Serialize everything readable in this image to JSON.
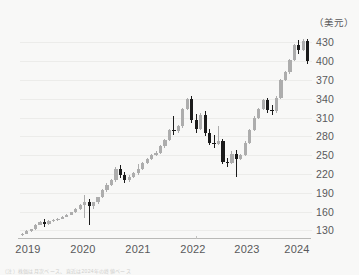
{
  "chart_data": {
    "type": "candlestick",
    "title": "",
    "xlabel": "",
    "ylabel": "",
    "unit_label": "（美元）",
    "ylim": [
      118,
      445
    ],
    "yticks": [
      430,
      400,
      370,
      340,
      310,
      280,
      250,
      220,
      190,
      160,
      130
    ],
    "xticks": [
      "2019",
      "2020",
      "2021",
      "2022",
      "2023",
      "2024"
    ],
    "grid": true,
    "legend": "none",
    "colors": {
      "up": "#adadad",
      "down": "#1b1b1b",
      "background": "#f8f8f7",
      "grid": "#ececea",
      "axis": "#b9b9b7",
      "text": "#58595b"
    },
    "candles": [
      {
        "o": 123,
        "h": 126,
        "l": 121,
        "c": 125
      },
      {
        "o": 125,
        "h": 130,
        "l": 124,
        "c": 129
      },
      {
        "o": 129,
        "h": 133,
        "l": 128,
        "c": 132
      },
      {
        "o": 132,
        "h": 140,
        "l": 131,
        "c": 139
      },
      {
        "o": 139,
        "h": 145,
        "l": 138,
        "c": 144
      },
      {
        "o": 144,
        "h": 149,
        "l": 136,
        "c": 140
      },
      {
        "o": 140,
        "h": 146,
        "l": 139,
        "c": 145
      },
      {
        "o": 145,
        "h": 148,
        "l": 143,
        "c": 147
      },
      {
        "o": 147,
        "h": 150,
        "l": 145,
        "c": 149
      },
      {
        "o": 149,
        "h": 153,
        "l": 148,
        "c": 152
      },
      {
        "o": 152,
        "h": 156,
        "l": 151,
        "c": 155
      },
      {
        "o": 155,
        "h": 160,
        "l": 154,
        "c": 159
      },
      {
        "o": 159,
        "h": 166,
        "l": 158,
        "c": 165
      },
      {
        "o": 165,
        "h": 172,
        "l": 163,
        "c": 171
      },
      {
        "o": 171,
        "h": 186,
        "l": 150,
        "c": 176
      },
      {
        "o": 176,
        "h": 180,
        "l": 139,
        "c": 169
      },
      {
        "o": 169,
        "h": 176,
        "l": 165,
        "c": 175
      },
      {
        "o": 175,
        "h": 184,
        "l": 173,
        "c": 183
      },
      {
        "o": 183,
        "h": 196,
        "l": 181,
        "c": 194
      },
      {
        "o": 194,
        "h": 205,
        "l": 192,
        "c": 203
      },
      {
        "o": 203,
        "h": 212,
        "l": 201,
        "c": 210
      },
      {
        "o": 210,
        "h": 231,
        "l": 208,
        "c": 228
      },
      {
        "o": 228,
        "h": 234,
        "l": 214,
        "c": 219
      },
      {
        "o": 219,
        "h": 224,
        "l": 206,
        "c": 210
      },
      {
        "o": 210,
        "h": 218,
        "l": 208,
        "c": 216
      },
      {
        "o": 216,
        "h": 223,
        "l": 214,
        "c": 221
      },
      {
        "o": 221,
        "h": 236,
        "l": 219,
        "c": 228
      },
      {
        "o": 228,
        "h": 240,
        "l": 226,
        "c": 238
      },
      {
        "o": 238,
        "h": 246,
        "l": 236,
        "c": 244
      },
      {
        "o": 244,
        "h": 252,
        "l": 242,
        "c": 250
      },
      {
        "o": 250,
        "h": 256,
        "l": 248,
        "c": 254
      },
      {
        "o": 254,
        "h": 266,
        "l": 252,
        "c": 264
      },
      {
        "o": 264,
        "h": 276,
        "l": 262,
        "c": 274
      },
      {
        "o": 274,
        "h": 292,
        "l": 272,
        "c": 290
      },
      {
        "o": 290,
        "h": 312,
        "l": 282,
        "c": 288
      },
      {
        "o": 288,
        "h": 298,
        "l": 286,
        "c": 296
      },
      {
        "o": 296,
        "h": 326,
        "l": 294,
        "c": 324
      },
      {
        "o": 324,
        "h": 342,
        "l": 322,
        "c": 340
      },
      {
        "o": 340,
        "h": 344,
        "l": 302,
        "c": 306
      },
      {
        "o": 306,
        "h": 316,
        "l": 286,
        "c": 292
      },
      {
        "o": 292,
        "h": 318,
        "l": 290,
        "c": 314
      },
      {
        "o": 314,
        "h": 320,
        "l": 280,
        "c": 286
      },
      {
        "o": 286,
        "h": 292,
        "l": 266,
        "c": 270
      },
      {
        "o": 270,
        "h": 282,
        "l": 262,
        "c": 268
      },
      {
        "o": 268,
        "h": 296,
        "l": 266,
        "c": 272
      },
      {
        "o": 272,
        "h": 276,
        "l": 236,
        "c": 240
      },
      {
        "o": 240,
        "h": 246,
        "l": 232,
        "c": 238
      },
      {
        "o": 238,
        "h": 256,
        "l": 236,
        "c": 252
      },
      {
        "o": 252,
        "h": 258,
        "l": 216,
        "c": 244
      },
      {
        "o": 244,
        "h": 252,
        "l": 242,
        "c": 250
      },
      {
        "o": 250,
        "h": 272,
        "l": 248,
        "c": 270
      },
      {
        "o": 270,
        "h": 292,
        "l": 268,
        "c": 290
      },
      {
        "o": 290,
        "h": 312,
        "l": 288,
        "c": 310
      },
      {
        "o": 310,
        "h": 326,
        "l": 308,
        "c": 324
      },
      {
        "o": 324,
        "h": 340,
        "l": 322,
        "c": 338
      },
      {
        "o": 338,
        "h": 342,
        "l": 318,
        "c": 322
      },
      {
        "o": 322,
        "h": 330,
        "l": 314,
        "c": 320
      },
      {
        "o": 320,
        "h": 344,
        "l": 318,
        "c": 342
      },
      {
        "o": 342,
        "h": 372,
        "l": 340,
        "c": 370
      },
      {
        "o": 370,
        "h": 384,
        "l": 368,
        "c": 382
      },
      {
        "o": 382,
        "h": 404,
        "l": 380,
        "c": 402
      },
      {
        "o": 402,
        "h": 428,
        "l": 400,
        "c": 426
      },
      {
        "o": 426,
        "h": 434,
        "l": 412,
        "c": 418
      },
      {
        "o": 418,
        "h": 436,
        "l": 416,
        "c": 432
      },
      {
        "o": 432,
        "h": 436,
        "l": 396,
        "c": 400
      }
    ]
  },
  "caption": {
    "text": "（注）株価は月次ベース、直近は2024年の終値ベース"
  }
}
